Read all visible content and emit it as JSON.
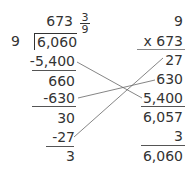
{
  "division": {
    "quotient": "673",
    "remainder_fraction": {
      "numerator": "3",
      "denominator": "9"
    },
    "divisor": "9",
    "dividend": "6,060",
    "steps": [
      "-5,400",
      "660",
      "-630",
      "30",
      "-27",
      "3"
    ]
  },
  "multiplication": {
    "top": "9",
    "multiplier": "x 673",
    "partials": [
      "27",
      "630",
      "5,400"
    ],
    "subtotal": "6,057",
    "add_remainder": "3",
    "total": "6,060"
  }
}
